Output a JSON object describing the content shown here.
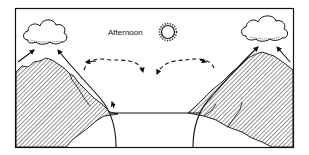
{
  "diagram": {
    "type": "mountain-valley-breeze",
    "time_label": "Afternoon",
    "icons": [
      "sun-icon",
      "cloud-icon-left",
      "cloud-icon-right"
    ],
    "elements": {
      "left_mountain": "hatched mountain slope, left",
      "right_mountain": "hatched mountain slope, right",
      "valley_floor": "horizontal line between mountains",
      "upslope_arrows": "solid arrows rising along slopes to clouds",
      "return_flow": "dashed arrows curving over valley and descending"
    },
    "colors": {
      "ink": "#111111",
      "background": "#ffffff"
    }
  }
}
